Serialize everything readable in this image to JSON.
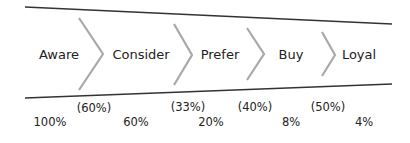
{
  "diagram": {
    "type": "funnel",
    "colors": {
      "border_line": "#333333",
      "chevron": "#a8a8a8",
      "text": "#222222"
    },
    "stages": [
      {
        "label": "Aware",
        "cumulative": "100%",
        "conversion": null
      },
      {
        "label": "Consider",
        "cumulative": "60%",
        "conversion": "(60%)"
      },
      {
        "label": "Prefer",
        "cumulative": "20%",
        "conversion": "(33%)"
      },
      {
        "label": "Buy",
        "cumulative": "8%",
        "conversion": "(40%)"
      },
      {
        "label": "Loyal",
        "cumulative": "4%",
        "conversion": "(50%)"
      }
    ]
  }
}
